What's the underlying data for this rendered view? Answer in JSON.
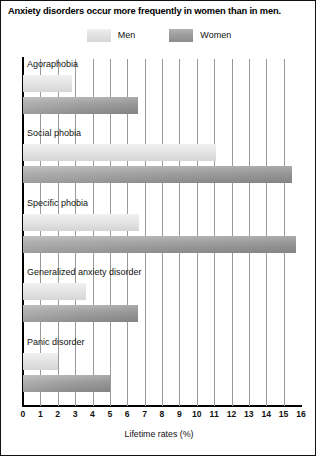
{
  "chart_data": {
    "type": "bar",
    "orientation": "horizontal",
    "title": "Anxiety disorders occur more frequently in women than in men.",
    "xlabel": "Lifetime rates (%)",
    "ylabel": "",
    "xlim": [
      0,
      16
    ],
    "xticks": [
      0,
      1,
      2,
      3,
      4,
      5,
      6,
      7,
      8,
      9,
      10,
      11,
      12,
      13,
      14,
      15,
      16
    ],
    "xtick_labels": [
      "0",
      "1",
      "2",
      "3",
      "4",
      "5",
      "6",
      "7",
      "8",
      "9",
      "10",
      "11",
      "12",
      "13",
      "14",
      "15",
      "16"
    ],
    "grid": "vertical",
    "legend_position": "top-center",
    "categories": [
      "Agoraphobia",
      "Social phobia",
      "Specific phobia",
      "Generalized anxiety disorder",
      "Panic disorder"
    ],
    "series": [
      {
        "name": "Men",
        "color": "#e2e2e2",
        "values": [
          2.8,
          11.1,
          6.7,
          3.6,
          2.0
        ]
      },
      {
        "name": "Women",
        "color": "#9d9d9d",
        "values": [
          6.6,
          15.5,
          15.7,
          6.6,
          5.0
        ]
      }
    ]
  },
  "legend": {
    "entries": [
      {
        "label": "Men",
        "swatch": "men-swatch"
      },
      {
        "label": "Women",
        "swatch": "women-swatch"
      }
    ]
  }
}
